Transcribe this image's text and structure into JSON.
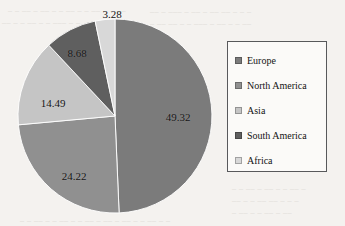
{
  "chart_data": {
    "type": "pie",
    "title": "",
    "labels": [
      "Europe",
      "North America",
      "Asia",
      "South America",
      "Africa"
    ],
    "values": [
      49.32,
      24.22,
      14.49,
      8.68,
      3.28
    ],
    "value_labels": [
      "49.32",
      "24.22",
      "14.49",
      "8.68",
      "3.28"
    ],
    "colors": [
      "#7b7b7b",
      "#909090",
      "#c5c5c5",
      "#5f5f5f",
      "#d8d8d8"
    ],
    "legend_position": "right",
    "grid": false,
    "start_angle_deg": 0,
    "direction": "clockwise",
    "units": "percent",
    "total": 99.99
  },
  "legend": {
    "items": [
      {
        "label": "Europe",
        "color": "#7b7b7b",
        "value": "49.32"
      },
      {
        "label": "North America",
        "color": "#909090",
        "value": "24.22"
      },
      {
        "label": "Asia",
        "color": "#c5c5c5",
        "value": "14.49"
      },
      {
        "label": "South America",
        "color": "#5f5f5f",
        "value": "8.68"
      },
      {
        "label": "Africa",
        "color": "#d8d8d8",
        "value": "3.28"
      }
    ]
  },
  "pie": {
    "center_x": 115,
    "center_y": 116,
    "radius": 97,
    "slices": [
      {
        "name": "Europe",
        "value": "49.32",
        "color": "#7b7b7b",
        "label_x": 178,
        "label_y": 117
      },
      {
        "name": "North America",
        "value": "24.22",
        "color": "#909090",
        "label_x": 74,
        "label_y": 176
      },
      {
        "name": "Asia",
        "value": "14.49",
        "color": "#c5c5c5",
        "label_x": 53,
        "label_y": 103
      },
      {
        "name": "South America",
        "value": "8.68",
        "color": "#5f5f5f",
        "label_x": 77,
        "label_y": 53
      },
      {
        "name": "Africa",
        "value": "3.28",
        "color": "#d8d8d8",
        "label_x": 112,
        "label_y": 14
      }
    ]
  }
}
